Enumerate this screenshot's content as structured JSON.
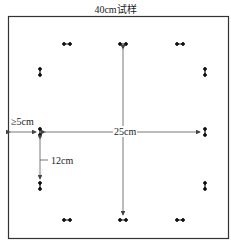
{
  "title": "40cm试样",
  "labels": {
    "min_edge": "≥5cm",
    "span": "25cm",
    "spacing": "12cm"
  },
  "colors": {
    "line": "#555555",
    "marker": "#111111",
    "border": "#333333"
  }
}
